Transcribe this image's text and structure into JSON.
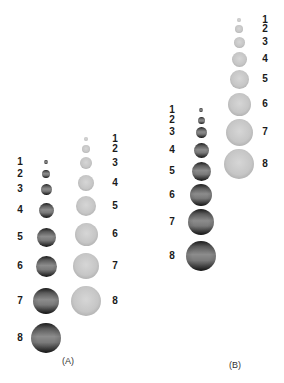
{
  "colors": {
    "dark_sphere": "#5a5a5a",
    "light_sphere": "#c6c6c6",
    "label": "#1a1a1a"
  },
  "panels": [
    {
      "caption": "(A)",
      "caption_pos": [
        68,
        361
      ],
      "columns": [
        {
          "shade": "dark",
          "label_x": 20,
          "sphere_x": 46,
          "items": [
            {
              "label": "1",
              "y": 162,
              "r": 2
            },
            {
              "label": "2",
              "y": 174,
              "r": 4
            },
            {
              "label": "3",
              "y": 189,
              "r": 5.5
            },
            {
              "label": "4",
              "y": 210,
              "r": 7.5
            },
            {
              "label": "5",
              "y": 237,
              "r": 9.5
            },
            {
              "label": "6",
              "y": 266,
              "r": 10.5
            },
            {
              "label": "7",
              "y": 301,
              "r": 13
            },
            {
              "label": "8",
              "y": 338,
              "r": 15
            }
          ]
        },
        {
          "shade": "light",
          "label_x": 115,
          "sphere_x": 86,
          "items": [
            {
              "label": "1",
              "y": 139,
              "r": 2
            },
            {
              "label": "2",
              "y": 149,
              "r": 4
            },
            {
              "label": "3",
              "y": 163,
              "r": 6
            },
            {
              "label": "4",
              "y": 183,
              "r": 8
            },
            {
              "label": "5",
              "y": 206,
              "r": 10
            },
            {
              "label": "6",
              "y": 234,
              "r": 11.5
            },
            {
              "label": "7",
              "y": 266,
              "r": 13
            },
            {
              "label": "8",
              "y": 301,
              "r": 15
            }
          ]
        }
      ]
    },
    {
      "caption": "(B)",
      "caption_pos": [
        235,
        365
      ],
      "columns": [
        {
          "shade": "dark",
          "label_x": 172,
          "sphere_x": 201,
          "items": [
            {
              "label": "1",
              "y": 110,
              "r": 2
            },
            {
              "label": "2",
              "y": 120,
              "r": 3.5
            },
            {
              "label": "3",
              "y": 132,
              "r": 5.5
            },
            {
              "label": "4",
              "y": 150,
              "r": 7.5
            },
            {
              "label": "5",
              "y": 171,
              "r": 9.5
            },
            {
              "label": "6",
              "y": 195,
              "r": 11
            },
            {
              "label": "7",
              "y": 222,
              "r": 13
            },
            {
              "label": "8",
              "y": 256,
              "r": 15
            }
          ]
        },
        {
          "shade": "light",
          "label_x": 265,
          "sphere_x": 239,
          "items": [
            {
              "label": "1",
              "y": 20,
              "r": 2
            },
            {
              "label": "2",
              "y": 29,
              "r": 4
            },
            {
              "label": "3",
              "y": 42,
              "r": 5.5
            },
            {
              "label": "4",
              "y": 59,
              "r": 7.5
            },
            {
              "label": "5",
              "y": 79,
              "r": 9.5
            },
            {
              "label": "6",
              "y": 104,
              "r": 11.5
            },
            {
              "label": "7",
              "y": 132,
              "r": 13.5
            },
            {
              "label": "8",
              "y": 164,
              "r": 15
            }
          ]
        }
      ]
    }
  ]
}
